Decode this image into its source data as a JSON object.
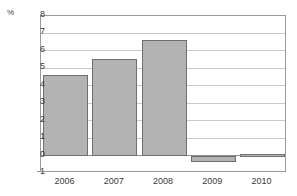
{
  "axis": {
    "unit_label": "%",
    "y_ticks": [
      "8",
      "7",
      "6",
      "5",
      "4",
      "3",
      "2",
      "1",
      "0",
      "-1"
    ],
    "x_ticks": [
      "2006",
      "2007",
      "2008",
      "2009",
      "2010"
    ]
  },
  "style": {
    "bar_fill": "#b3b3b3",
    "bar_stroke": "#6f6f6f",
    "grid_color": "#c9c9c9",
    "frame_color": "#9a9a9a",
    "text_color": "#3a3a3a",
    "background": "#ffffff"
  },
  "chart_data": {
    "type": "bar",
    "title": "",
    "subtitle": "",
    "xlabel": "",
    "ylabel": "%",
    "categories": [
      "2006",
      "2007",
      "2008",
      "2009",
      "2010"
    ],
    "values": [
      4.6,
      5.55,
      6.65,
      -0.35,
      0.1
    ],
    "ylim": [
      -1,
      8
    ],
    "ytick_step": 1,
    "grid": true,
    "legend": false,
    "legend_position": "none",
    "series": [
      {
        "name": "",
        "values": [
          4.6,
          5.55,
          6.65,
          -0.35,
          0.1
        ]
      }
    ]
  }
}
